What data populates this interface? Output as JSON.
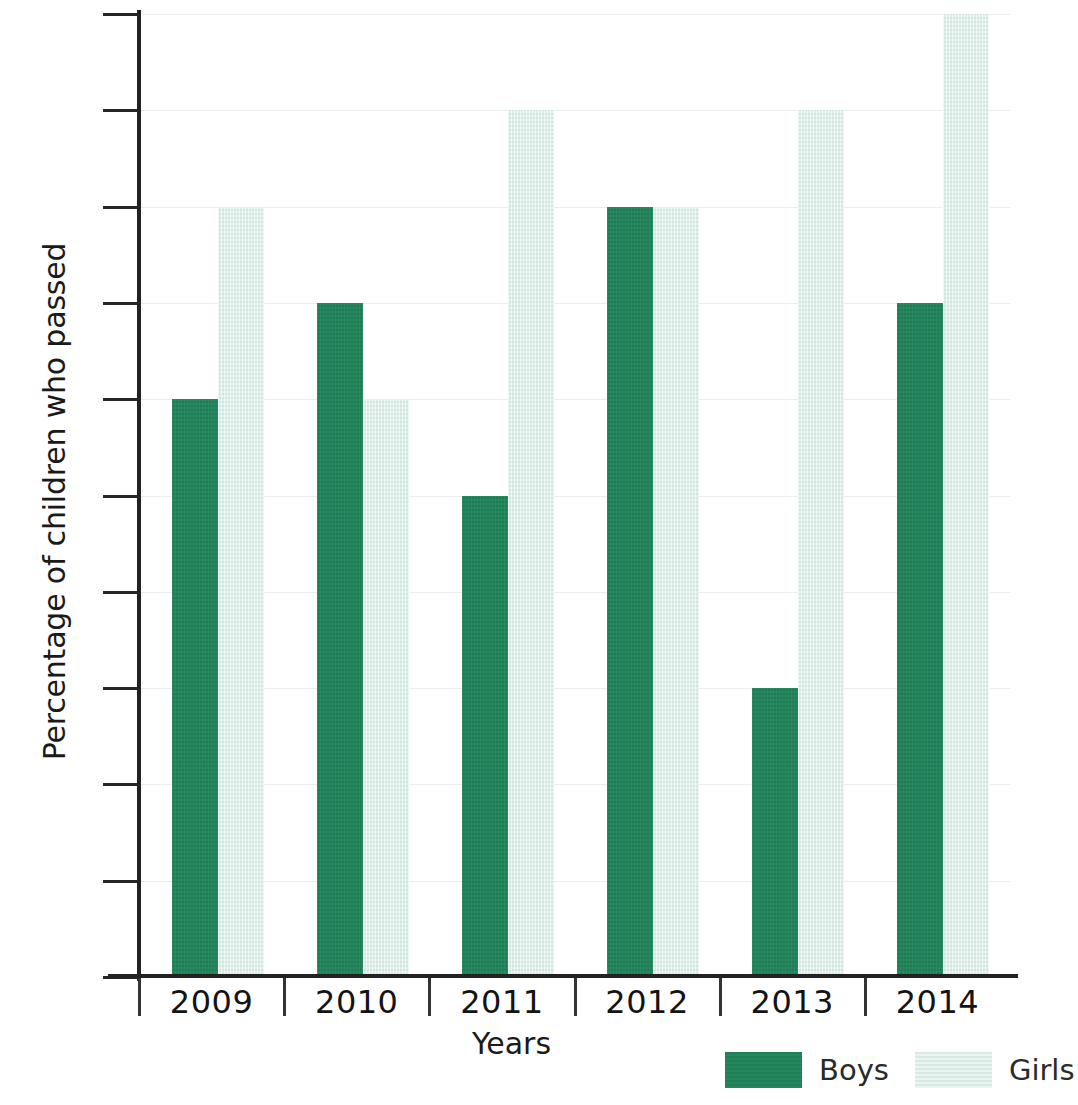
{
  "chart_data": {
    "type": "bar",
    "title": "",
    "subtitle": "",
    "xlabel": "Years",
    "ylabel": "Percentage of children who passed",
    "categories": [
      "2009",
      "2010",
      "2011",
      "2012",
      "2013",
      "2014"
    ],
    "series": [
      {
        "name": "Boys",
        "color": "#1f8359",
        "values": [
          60,
          70,
          50,
          80,
          30,
          70
        ]
      },
      {
        "name": "Girls",
        "color": "#dcefe8",
        "values": [
          80,
          60,
          90,
          80,
          90,
          100
        ]
      }
    ],
    "ylim": [
      0,
      100
    ],
    "ytick_labels": [
      "0",
      "10",
      "20",
      "30",
      "40",
      "50",
      "60",
      "70",
      "80",
      "90",
      "100"
    ],
    "ytick_values": [
      0,
      10,
      20,
      30,
      40,
      50,
      60,
      70,
      80,
      90,
      100
    ],
    "grid": true,
    "grid_axis": "y",
    "legend_position": "bottom-right",
    "legend_entries": [
      "Boys",
      "Girls"
    ],
    "bar_mode": "grouped",
    "annotations": []
  },
  "axis": {
    "y_title": "Percentage of children who passed",
    "x_title": "Years"
  },
  "colors": {
    "boys": "#1f8359",
    "girls": "#dcefe8",
    "axis": "#222222",
    "grid": "#e9eeec",
    "background": "#ffffff"
  }
}
